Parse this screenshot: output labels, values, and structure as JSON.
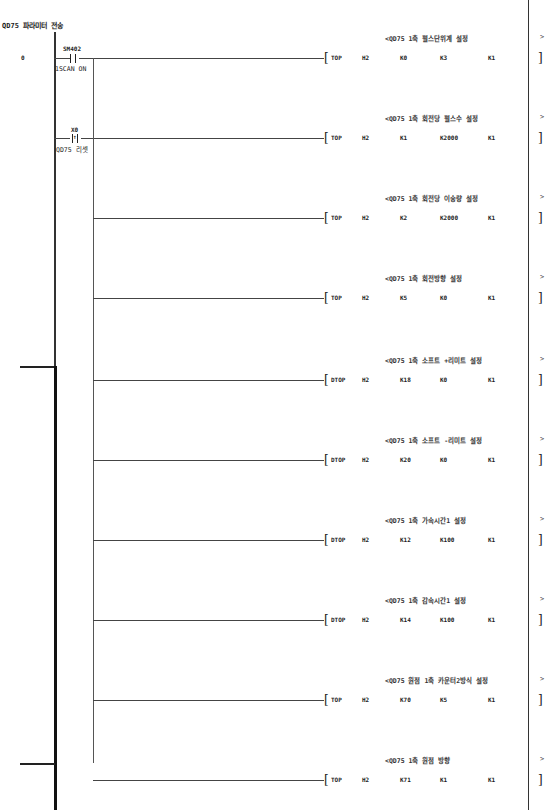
{
  "diagram": {
    "title": "QD75 파라미터 전송",
    "step_number": "0",
    "contacts": [
      {
        "device": "SM402",
        "comment": "1SCAN ON",
        "type": "normally-open"
      },
      {
        "device": "X0",
        "comment": "QD75 리셋",
        "type": "rising-edge"
      }
    ],
    "rungs": [
      {
        "comment": "<QD75 1축 펄스단위계 설정",
        "instr": "TOP",
        "args": [
          "H2",
          "K0",
          "K3",
          "K1"
        ]
      },
      {
        "comment": "<QD75 1축 회전당 펄스수 설정",
        "instr": "TOP",
        "args": [
          "H2",
          "K1",
          "K2000",
          "K1"
        ]
      },
      {
        "comment": "<QD75 1축 회전당 이송량 설정",
        "instr": "TOP",
        "args": [
          "H2",
          "K2",
          "K2000",
          "K1"
        ]
      },
      {
        "comment": "<QD75 1축 회전방향 설정",
        "instr": "TOP",
        "args": [
          "H2",
          "K5",
          "K0",
          "K1"
        ]
      },
      {
        "comment": "<QD75 1축 소프트 +리미트 설정",
        "instr": "DTOP",
        "args": [
          "H2",
          "K18",
          "K0",
          "K1"
        ]
      },
      {
        "comment": "<QD75 1축 소프트 -리미트 설정",
        "instr": "DTOP",
        "args": [
          "H2",
          "K20",
          "K0",
          "K1"
        ]
      },
      {
        "comment": "<QD75 1축 가속시간1 설정",
        "instr": "DTOP",
        "args": [
          "H2",
          "K12",
          "K100",
          "K1"
        ]
      },
      {
        "comment": "<QD75 1축 감속시간1 설정",
        "instr": "DTOP",
        "args": [
          "H2",
          "K14",
          "K100",
          "K1"
        ]
      },
      {
        "comment": "<QD75 원점 1축 카운터2방식 설정",
        "instr": "TOP",
        "args": [
          "H2",
          "K70",
          "K5",
          "K1"
        ]
      },
      {
        "comment": "<QD75 1축 원점 방향",
        "instr": "TOP",
        "args": [
          "H2",
          "K71",
          "K1",
          "K1"
        ]
      }
    ],
    "end_marker": ">",
    "open_bracket": "[",
    "close_bracket": "]"
  }
}
